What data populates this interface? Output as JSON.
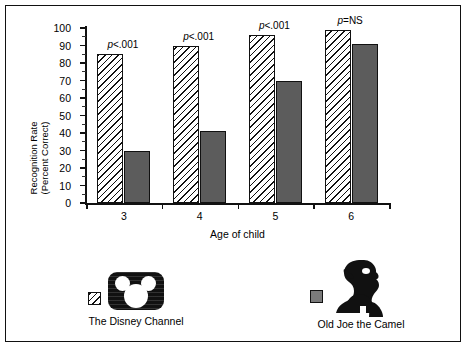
{
  "chart_data": {
    "type": "bar",
    "title": "",
    "xlabel": "Age of child",
    "ylabel": "Recognition Rate\n(Percent Correct)",
    "categories": [
      "3",
      "4",
      "5",
      "6"
    ],
    "ylim": [
      0,
      100
    ],
    "ytick_major": [
      0,
      10,
      20,
      30,
      40,
      50,
      60,
      70,
      80,
      90,
      100
    ],
    "ytick_labels": [
      "0",
      "10",
      "20",
      "30",
      "40",
      "50",
      "60",
      "70",
      "80",
      "90",
      "100"
    ],
    "grid": false,
    "legend_position": "bottom",
    "series": [
      {
        "name": "The Disney Channel",
        "fill": "diagonal-hatch",
        "color": "#ffffff",
        "values": [
          85,
          90,
          96,
          99
        ]
      },
      {
        "name": "Old Joe the Camel",
        "fill": "solid-gray",
        "color": "#5c5c5c",
        "values": [
          30,
          41,
          70,
          91
        ]
      }
    ],
    "annotations": [
      {
        "category": "3",
        "text": "p<.001"
      },
      {
        "category": "4",
        "text": "p<.001"
      },
      {
        "category": "5",
        "text": "p<.001"
      },
      {
        "category": "6",
        "text": "p=NS"
      }
    ]
  },
  "legend": {
    "items": [
      {
        "label": "The Disney Channel",
        "swatch": "hatched-swatch",
        "logo": "disney-channel-logo"
      },
      {
        "label": "Old Joe the Camel",
        "swatch": "gray-swatch",
        "logo": "old-joe-camel-logo"
      }
    ]
  },
  "axis": {
    "y_label_line1": "Recognition Rate",
    "y_label_line2": "(Percent Correct)",
    "x_label": "Age of child"
  }
}
